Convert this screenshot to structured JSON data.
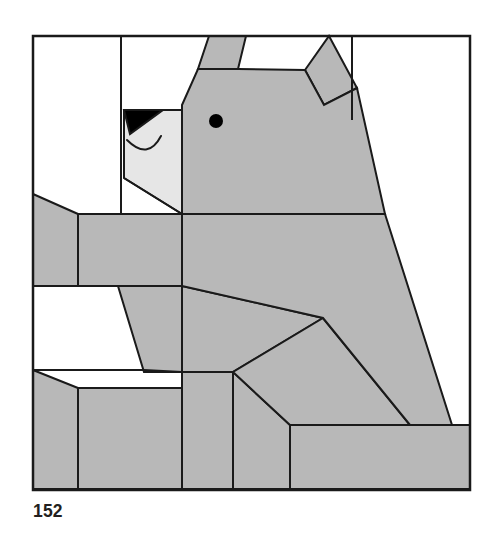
{
  "page": {
    "caption": "152",
    "background_color": "#ffffff"
  },
  "figure": {
    "colors": {
      "fill_gray": "#b8b8b8",
      "fill_light_gray": "#e6e6e6",
      "fill_white": "#ffffff",
      "stroke": "#1a1a1a",
      "nose_black": "#000000",
      "eye_black": "#000000"
    },
    "frame": {
      "x": 33,
      "y": 36,
      "width": 437,
      "height": 454,
      "stroke_width": 2
    },
    "shapes": [
      {
        "name": "left-ear",
        "fill": "#b8b8b8",
        "points": "209,36 246,36 238,69 198,69"
      },
      {
        "name": "right-ear",
        "fill": "#b8b8b8",
        "points": "329,36 357,88 324,105 305,70"
      },
      {
        "name": "head",
        "fill": "#b8b8b8",
        "points": "198,69 238,69 305,70 324,105 357,88 385,214 182,214 182,105"
      },
      {
        "name": "muzzle",
        "fill": "#e6e6e6",
        "points": "124,110 182,110 182,214 124,178"
      },
      {
        "name": "nose",
        "fill": "#000000",
        "points": "124,110 163,110 130,134"
      },
      {
        "name": "eye",
        "type": "circle",
        "fill": "#000000",
        "cx": 216,
        "cy": 121,
        "r": 7
      },
      {
        "name": "mouth",
        "type": "path",
        "stroke": "#1a1a1a",
        "d": "M 127 140 Q 146 160 160 136"
      },
      {
        "name": "upper-back-haunch",
        "fill": "#b8b8b8",
        "points": "385,214 452,425 410,425 323,318 182,286 182,214"
      },
      {
        "name": "shoulder-wedge",
        "fill": "#b8b8b8",
        "points": "182,214 385,214 182,286"
      },
      {
        "name": "left-shoulder-slab",
        "fill": "#b8b8b8",
        "points": "78,214 182,214 182,286 78,286"
      },
      {
        "name": "left-shoulder-bevel",
        "fill": "#b8b8b8",
        "points": "33,194 78,214 78,286 33,286"
      },
      {
        "name": "foreleg-upper",
        "fill": "#b8b8b8",
        "points": "118,286 182,286 182,372 144,372"
      },
      {
        "name": "lower-belly-band",
        "fill": "#b8b8b8",
        "points": "182,286 323,318 233,372 182,372"
      },
      {
        "name": "rear-haunch",
        "fill": "#b8b8b8",
        "points": "323,318 410,425 290,425 233,372"
      },
      {
        "name": "foot-front-left",
        "fill": "#b8b8b8",
        "points": "33,370 78,388 78,489 33,489"
      },
      {
        "name": "foot-front-right",
        "fill": "#b8b8b8",
        "points": "78,388 182,388 182,489 78,489"
      },
      {
        "name": "leg-column-middle",
        "fill": "#b8b8b8",
        "points": "182,372 233,372 233,489 182,489"
      },
      {
        "name": "leg-column-rear",
        "fill": "#b8b8b8",
        "points": "233,372 290,425 290,489 233,489"
      },
      {
        "name": "rear-foot",
        "fill": "#b8b8b8",
        "points": "290,425 470,425 470,489 290,489"
      }
    ],
    "guide_lines": [
      {
        "name": "frame-vertical-left",
        "x1": 121,
        "y1": 36,
        "x2": 121,
        "y2": 214
      },
      {
        "name": "frame-vertical-head-right",
        "x1": 352,
        "y1": 36,
        "x2": 352,
        "y2": 95
      },
      {
        "name": "frame-vertical-right-upper",
        "x1": 352,
        "y1": 95,
        "x2": 352,
        "y2": 120
      },
      {
        "name": "muzzle-lower-edge",
        "x1": 124,
        "y1": 178,
        "x2": 182,
        "y2": 214
      }
    ]
  }
}
